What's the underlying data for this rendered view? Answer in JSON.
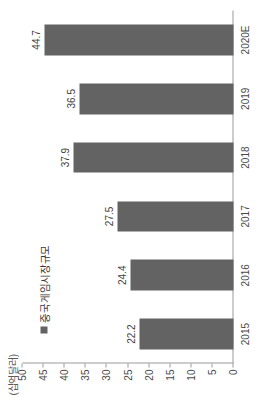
{
  "chart_data": {
    "type": "bar",
    "orientation": "vertical",
    "title": "",
    "subtitle": "",
    "unit_label": "(십억달러)",
    "xlabel": "",
    "ylabel": "",
    "categories": [
      "2015",
      "2016",
      "2017",
      "2018",
      "2019",
      "2020E"
    ],
    "values": [
      22.2,
      24.4,
      27.5,
      37.9,
      36.5,
      44.7
    ],
    "value_labels": [
      "22.2",
      "24.4",
      "27.5",
      "37.9",
      "36.5",
      "44.7"
    ],
    "series": [
      {
        "name": "중국게임시장규모",
        "values": [
          22.2,
          24.4,
          27.5,
          37.9,
          36.5,
          44.7
        ],
        "color": "#636363"
      }
    ],
    "legend": {
      "position": "top-left",
      "entries": [
        {
          "label": "중국게임시장규모",
          "color": "#636363",
          "marker": "square-marker"
        }
      ]
    },
    "ylim": [
      0,
      50
    ],
    "ytick_values": [
      0,
      5,
      10,
      15,
      20,
      25,
      30,
      35,
      40,
      45,
      50
    ],
    "ytick_labels": [
      "0",
      "5",
      "10",
      "15",
      "20",
      "25",
      "30",
      "35",
      "40",
      "45",
      "50"
    ],
    "grid": false,
    "axis_color": "#9a9a9a",
    "background_color": "#ffffff",
    "rotation_degrees": -90
  }
}
